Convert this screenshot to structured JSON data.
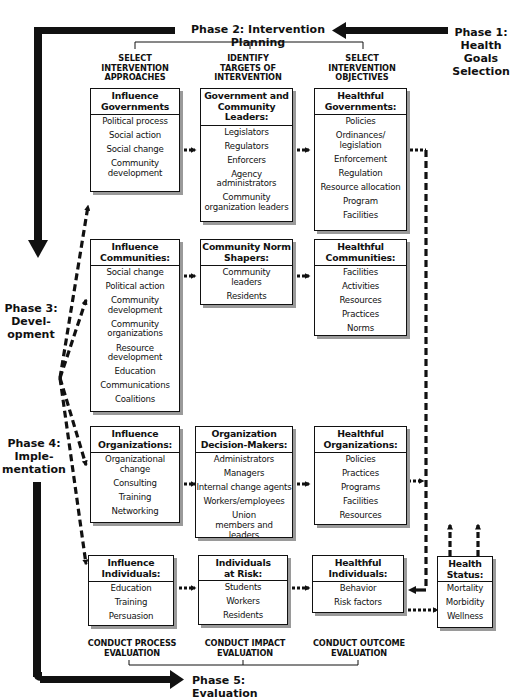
{
  "phases": {
    "phase1": "Phase 1: Health Goals Selection",
    "phase1_lines": [
      "Phase 1:",
      "Health",
      "Goals",
      "Selection"
    ],
    "phase2": "Phase 2: Intervention Planning",
    "phase3_lines": [
      "Phase 3:",
      "Devel-",
      "opment"
    ],
    "phase4_lines": [
      "Phase 4:",
      "Imple-",
      "mentation"
    ],
    "phase5": "Phase 5: Evaluation"
  },
  "column_headers": [
    {
      "lines": [
        "SELECT",
        "INTERVENTION",
        "APPROACHES"
      ]
    },
    {
      "lines": [
        "IDENTIFY",
        "TARGETS OF",
        "INTERVENTION"
      ]
    },
    {
      "lines": [
        "SELECT",
        "INTERVENTION",
        "OBJECTIVES"
      ]
    }
  ],
  "rows": [
    {
      "approach": {
        "title": "Influence Governments",
        "items": [
          "Political process",
          "Social action",
          "Social change",
          "Community development"
        ]
      },
      "target": {
        "title": "Government and Community Leaders:",
        "items": [
          "Legislators",
          "Regulators",
          "Enforcers",
          "Agency administrators",
          "Community organization leaders"
        ]
      },
      "objective": {
        "title": "Healthful Governments:",
        "items": [
          "Policies",
          "Ordinances/ legislation",
          "Enforcement",
          "Regulation",
          "Resource allocation",
          "Program",
          "Facilities"
        ]
      }
    },
    {
      "approach": {
        "title": "Influence Communities:",
        "items": [
          "Social change",
          "Political action",
          "Community development",
          "Community organizations",
          "Resource development",
          "Education",
          "Communications",
          "Coalitions"
        ]
      },
      "target": {
        "title": "Community Norm Shapers:",
        "items": [
          "Community leaders",
          "Residents"
        ]
      },
      "objective": {
        "title": "Healthful Communities:",
        "items": [
          "Facilities",
          "Activities",
          "Resources",
          "Practices",
          "Norms"
        ]
      }
    },
    {
      "approach": {
        "title": "Influence Organizations:",
        "items": [
          "Organizational change",
          "Consulting",
          "Training",
          "Networking"
        ]
      },
      "target": {
        "title": "Organization Decision-Makers:",
        "items": [
          "Administrators",
          "Managers",
          "Internal change agents",
          "Workers/employees",
          "Union members and leaders"
        ]
      },
      "objective": {
        "title": "Healthful Organizations:",
        "items": [
          "Policies",
          "Practices",
          "Programs",
          "Facilities",
          "Resources"
        ]
      }
    },
    {
      "approach": {
        "title": "Influence Individuals:",
        "items": [
          "Education",
          "Training",
          "Persuasion"
        ]
      },
      "target": {
        "title": "Individuals at Risk:",
        "items": [
          "Students",
          "Workers",
          "Residents"
        ]
      },
      "objective": {
        "title": "Healthful Individuals:",
        "items": [
          "Behavior",
          "Risk factors"
        ]
      }
    }
  ],
  "health_status": {
    "title": "Health Status:",
    "items": [
      "Mortality",
      "Morbidity",
      "Wellness"
    ]
  },
  "evaluation_headers": [
    {
      "lines": [
        "CONDUCT PROCESS",
        "EVALUATION"
      ]
    },
    {
      "lines": [
        "CONDUCT IMPACT",
        "EVALUATION"
      ]
    },
    {
      "lines": [
        "CONDUCT OUTCOME",
        "EVALUATION"
      ]
    }
  ],
  "colors": {
    "ink": "#111111",
    "shadow": "#9a9a9a",
    "background": "#ffffff"
  }
}
